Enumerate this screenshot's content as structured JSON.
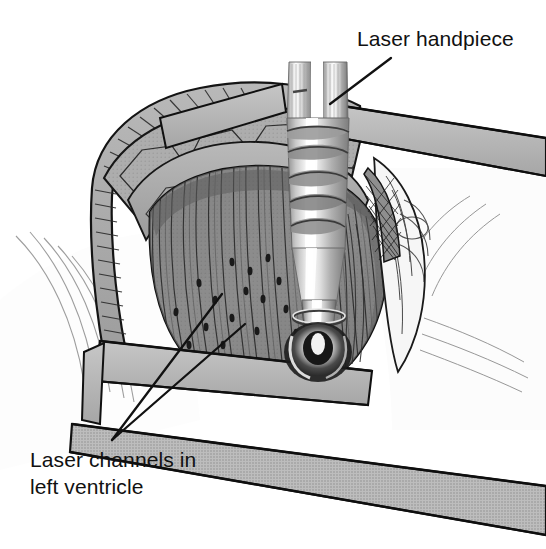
{
  "figure": {
    "background_color": "#ffffff",
    "width": 546,
    "height": 549,
    "style": "black-and-white halftone medical line illustration"
  },
  "annotations": [
    {
      "id": "laser-handpiece",
      "label": "Laser handpiece",
      "text_x": 357,
      "text_y": 46,
      "leader": {
        "x1": 391,
        "y1": 58,
        "x2": 330,
        "y2": 104
      }
    },
    {
      "id": "laser-channels",
      "label_line_1": "Laser channels in",
      "label_line_2": "left ventricle",
      "text_x": 30,
      "text_y": 467,
      "leaders": [
        {
          "x1": 112,
          "y1": 440,
          "x2": 222,
          "y2": 294
        },
        {
          "x1": 112,
          "y1": 440,
          "x2": 245,
          "y2": 324
        }
      ]
    }
  ],
  "anatomy": {
    "myocardium": {
      "name": "left ventricle myocardium",
      "fill": "#8c8c8c",
      "fiber_line_color": "#3a3a3a",
      "description": "exposed ventricular muscle with vertical fiber striations"
    },
    "pericardial_fat": {
      "name": "epicardial fat and pericardium",
      "fill": "#ababab",
      "cell_outline_color": "#333333",
      "description": "polygonal lobulated fat over the pericardial reflection"
    },
    "pericardial_edge": {
      "name": "cut pericardial edge",
      "fill": "#9a9a9a",
      "hatch_color": "#2b2b2b"
    },
    "laser_channels": {
      "name": "laser channels",
      "color": "#1a1a1a",
      "count": 17,
      "points": [
        [
          232,
          262
        ],
        [
          250,
          271
        ],
        [
          268,
          258
        ],
        [
          246,
          291
        ],
        [
          263,
          299
        ],
        [
          215,
          300
        ],
        [
          199,
          283
        ],
        [
          279,
          281
        ],
        [
          286,
          309
        ],
        [
          232,
          318
        ],
        [
          206,
          327
        ],
        [
          176,
          312
        ],
        [
          257,
          331
        ],
        [
          296,
          333
        ],
        [
          305,
          296
        ],
        [
          189,
          345
        ],
        [
          223,
          345
        ]
      ]
    }
  },
  "instruments": {
    "handpiece": {
      "name": "laser handpiece",
      "body_fill": "#d6d6d6",
      "highlight": "#ffffff",
      "shadow": "#6e6e6e",
      "shaft_top_y": 62,
      "tip_y": 372,
      "description": "vertical cylindrical handpiece with two finger grips, knurled rings and a glowing tip in contact with the myocardium"
    },
    "retractor_bands": {
      "name": "retractor blades and drapes",
      "fill": "#b4b4b4",
      "edge_color": "#111111",
      "count": 4
    },
    "drapes": {
      "name": "surgical drapes",
      "fill": "#fbfbfb",
      "fold_line_color": "#6b6b6b"
    }
  },
  "colors": {
    "ink": "#111111",
    "paper": "#ffffff",
    "mid_gray": "#8c8c8c",
    "light_gray": "#b4b4b4",
    "pale_gray": "#d6d6d6",
    "dark_gray": "#4a4a4a"
  }
}
